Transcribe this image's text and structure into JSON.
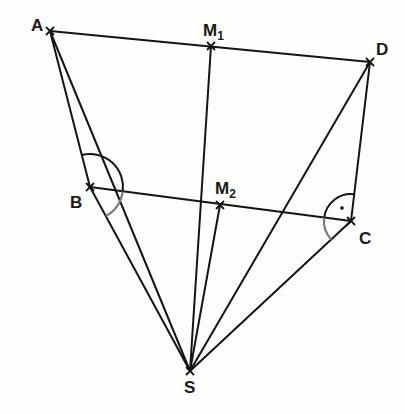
{
  "diagram": {
    "type": "geometry-pyramid",
    "colors": {
      "line": "#141414",
      "arc_primary": "#141414",
      "arc_secondary": "#7a7a7a",
      "background": "#fdfdfc"
    },
    "points": [
      {
        "id": "A",
        "label": "A",
        "sub": "",
        "x": 50,
        "y": 31
      },
      {
        "id": "M1",
        "label": "M",
        "sub": "1",
        "x": 211,
        "y": 46
      },
      {
        "id": "D",
        "label": "D",
        "sub": "",
        "x": 370,
        "y": 62
      },
      {
        "id": "B",
        "label": "B",
        "sub": "",
        "x": 90,
        "y": 187
      },
      {
        "id": "M2",
        "label": "M",
        "sub": "2",
        "x": 220,
        "y": 205
      },
      {
        "id": "C",
        "label": "C",
        "sub": "",
        "x": 351,
        "y": 221
      },
      {
        "id": "S",
        "label": "S",
        "sub": "",
        "x": 190,
        "y": 371
      }
    ],
    "segments": [
      [
        "A",
        "D"
      ],
      [
        "B",
        "C"
      ],
      [
        "A",
        "B"
      ],
      [
        "D",
        "C"
      ],
      [
        "A",
        "S"
      ],
      [
        "B",
        "S"
      ],
      [
        "M1",
        "S"
      ],
      [
        "M2",
        "S"
      ],
      [
        "D",
        "S"
      ],
      [
        "C",
        "S"
      ]
    ],
    "angle_marks": [
      {
        "vertex": "B",
        "between": [
          "A",
          "C"
        ],
        "style": "primary",
        "radius": 33
      },
      {
        "vertex": "B",
        "between": [
          "C",
          "S"
        ],
        "style": "secondary",
        "radius": 33
      },
      {
        "vertex": "C",
        "between": [
          "D",
          "B"
        ],
        "style": "primary",
        "radius": 27,
        "right_angle_dot": true
      },
      {
        "vertex": "C",
        "between": [
          "B",
          "S"
        ],
        "style": "secondary",
        "radius": 27
      }
    ]
  },
  "labels": {
    "A": "A",
    "B": "B",
    "C": "C",
    "D": "D",
    "S": "S",
    "M1": "M",
    "M1_sub": "1",
    "M2": "M",
    "M2_sub": "2"
  }
}
